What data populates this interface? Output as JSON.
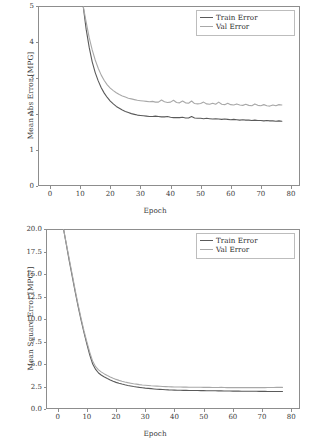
{
  "figure": {
    "background": "#ffffff",
    "axis_color": "#8d8d8d",
    "text_color": "#3a3a3a"
  },
  "series_colors": {
    "train": "#5a5a5a",
    "val": "#a8a8a8"
  },
  "legend": {
    "train_label": "Train Error",
    "val_label": "Val Error"
  },
  "chart_data": [
    {
      "id": "mean-abs-error",
      "type": "line",
      "title": "",
      "xlabel": "Epoch",
      "ylabel": "Mean Abs Error [MPG]",
      "xlim": [
        -4,
        83
      ],
      "ylim": [
        0,
        5
      ],
      "xticks": [
        0,
        10,
        20,
        30,
        40,
        50,
        60,
        70,
        80
      ],
      "xticklabels": [
        "0",
        "10",
        "20",
        "30",
        "40",
        "50",
        "60",
        "70",
        "80"
      ],
      "yticks": [
        0,
        1,
        2,
        3,
        4,
        5
      ],
      "yticklabels": [
        "0",
        "1",
        "2",
        "3",
        "4",
        "5"
      ],
      "grid": false,
      "legend_position": "upper right",
      "x": [
        11,
        12,
        13,
        14,
        15,
        16,
        17,
        18,
        19,
        20,
        21,
        22,
        23,
        24,
        25,
        26,
        27,
        28,
        29,
        30,
        31,
        32,
        33,
        34,
        35,
        36,
        37,
        38,
        39,
        40,
        41,
        42,
        43,
        44,
        45,
        46,
        47,
        48,
        49,
        50,
        51,
        52,
        53,
        54,
        55,
        56,
        57,
        58,
        59,
        60,
        61,
        62,
        63,
        64,
        65,
        66,
        67,
        68,
        69,
        70,
        71,
        72,
        73,
        74,
        75,
        76,
        77
      ],
      "series": [
        {
          "name": "Train Error",
          "values": [
            5.0,
            4.35,
            3.85,
            3.45,
            3.15,
            2.92,
            2.73,
            2.58,
            2.46,
            2.36,
            2.28,
            2.21,
            2.16,
            2.11,
            2.07,
            2.04,
            2.01,
            1.99,
            1.97,
            1.96,
            1.95,
            1.94,
            1.93,
            1.93,
            1.94,
            1.93,
            1.92,
            1.92,
            1.93,
            1.91,
            1.9,
            1.9,
            1.9,
            1.91,
            1.89,
            1.89,
            1.93,
            1.89,
            1.88,
            1.88,
            1.87,
            1.88,
            1.87,
            1.86,
            1.87,
            1.86,
            1.85,
            1.86,
            1.85,
            1.84,
            1.85,
            1.84,
            1.83,
            1.84,
            1.83,
            1.83,
            1.82,
            1.83,
            1.82,
            1.82,
            1.81,
            1.82,
            1.81,
            1.81,
            1.8,
            1.81,
            1.8
          ]
        },
        {
          "name": "Val Error",
          "values": [
            5.0,
            4.55,
            4.12,
            3.78,
            3.5,
            3.27,
            3.08,
            2.93,
            2.81,
            2.72,
            2.65,
            2.59,
            2.54,
            2.5,
            2.47,
            2.44,
            2.42,
            2.4,
            2.38,
            2.37,
            2.36,
            2.35,
            2.34,
            2.35,
            2.33,
            2.33,
            2.39,
            2.34,
            2.32,
            2.33,
            2.38,
            2.32,
            2.31,
            2.36,
            2.31,
            2.3,
            2.36,
            2.29,
            2.28,
            2.29,
            2.33,
            2.28,
            2.27,
            2.3,
            2.27,
            2.33,
            2.27,
            2.26,
            2.3,
            2.26,
            2.25,
            2.28,
            2.25,
            2.24,
            2.27,
            2.24,
            2.23,
            2.28,
            2.24,
            2.23,
            2.26,
            2.23,
            2.22,
            2.25,
            2.23,
            2.26,
            2.25
          ]
        }
      ]
    },
    {
      "id": "mean-square-error",
      "type": "line",
      "title": "",
      "xlabel": "Epoch",
      "ylabel": "Mean Square Error [MPG²]",
      "xlim": [
        -4,
        83
      ],
      "ylim": [
        0,
        20
      ],
      "xticks": [
        0,
        10,
        20,
        30,
        40,
        50,
        60,
        70,
        80
      ],
      "xticklabels": [
        "0",
        "10",
        "20",
        "30",
        "40",
        "50",
        "60",
        "70",
        "80"
      ],
      "yticks": [
        0,
        2.5,
        5,
        7.5,
        10,
        12.5,
        15,
        17.5,
        20
      ],
      "yticklabels": [
        "0.0",
        "2.5",
        "5.0",
        "7.5",
        "10.0",
        "12.5",
        "15.0",
        "17.5",
        "20.0"
      ],
      "grid": false,
      "legend_position": "upper right",
      "x": [
        2,
        3,
        4,
        5,
        6,
        7,
        8,
        9,
        10,
        11,
        12,
        13,
        14,
        15,
        16,
        17,
        18,
        19,
        20,
        21,
        22,
        23,
        24,
        25,
        26,
        27,
        28,
        29,
        30,
        31,
        32,
        33,
        34,
        35,
        36,
        37,
        38,
        39,
        40,
        41,
        42,
        43,
        44,
        45,
        46,
        47,
        48,
        49,
        50,
        51,
        52,
        53,
        54,
        55,
        56,
        57,
        58,
        59,
        60,
        61,
        62,
        63,
        64,
        65,
        66,
        67,
        68,
        69,
        70,
        71,
        72,
        73,
        74,
        75,
        76,
        77
      ],
      "series": [
        {
          "name": "Train Error",
          "values": [
            20.0,
            18.2,
            16.4,
            14.7,
            13.0,
            11.4,
            9.9,
            8.5,
            7.2,
            6.0,
            5.0,
            4.4,
            4.0,
            3.75,
            3.55,
            3.38,
            3.22,
            3.08,
            2.96,
            2.86,
            2.77,
            2.69,
            2.62,
            2.56,
            2.5,
            2.45,
            2.4,
            2.36,
            2.32,
            2.29,
            2.26,
            2.23,
            2.2,
            2.18,
            2.16,
            2.14,
            2.12,
            2.11,
            2.1,
            2.09,
            2.08,
            2.07,
            2.07,
            2.06,
            2.06,
            2.05,
            2.05,
            2.04,
            2.04,
            2.03,
            2.03,
            2.02,
            2.02,
            2.01,
            2.01,
            2.0,
            2.0,
            2.0,
            1.99,
            1.99,
            1.99,
            1.98,
            1.98,
            1.98,
            1.97,
            1.97,
            1.97,
            1.96,
            1.96,
            1.96,
            1.95,
            1.95,
            1.95,
            1.94,
            1.94,
            1.94
          ]
        },
        {
          "name": "Val Error",
          "values": [
            20.0,
            18.3,
            16.6,
            14.9,
            13.2,
            11.6,
            10.1,
            8.7,
            7.45,
            6.3,
            5.3,
            4.7,
            4.35,
            4.1,
            3.9,
            3.72,
            3.56,
            3.42,
            3.29,
            3.18,
            3.08,
            3.0,
            2.93,
            2.87,
            2.81,
            2.76,
            2.71,
            2.67,
            2.64,
            2.61,
            2.58,
            2.56,
            2.54,
            2.52,
            2.5,
            2.49,
            2.47,
            2.46,
            2.45,
            2.44,
            2.44,
            2.43,
            2.43,
            2.42,
            2.42,
            2.41,
            2.41,
            2.41,
            2.4,
            2.4,
            2.4,
            2.39,
            2.39,
            2.39,
            2.42,
            2.39,
            2.38,
            2.38,
            2.38,
            2.38,
            2.37,
            2.37,
            2.37,
            2.37,
            2.37,
            2.38,
            2.38,
            2.38,
            2.38,
            2.38,
            2.39,
            2.39,
            2.39,
            2.4,
            2.4,
            2.4
          ]
        }
      ]
    }
  ]
}
